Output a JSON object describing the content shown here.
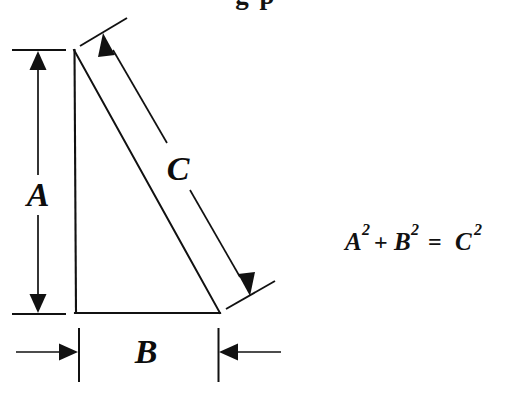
{
  "figure": {
    "kind": "geometry-diagram",
    "background_color": "#ffffff",
    "ink_color": "#111111",
    "width": 512,
    "height": 396
  },
  "clipped_title": {
    "text": "g  p",
    "note_visible": "partially cropped text at very top edge"
  },
  "labels": {
    "side_a": "A",
    "side_b": "B",
    "side_c": "C"
  },
  "equation": {
    "full": "A² + B² = C²",
    "term1_base": "A",
    "term1_exp": "2",
    "operator_plus": "+",
    "term2_base": "B",
    "term2_exp": "2",
    "operator_equals": "=",
    "term3_base": "C",
    "term3_exp": "2"
  },
  "geometry": {
    "triangle": {
      "apex": [
        73,
        50
      ],
      "bottom_left": [
        76,
        313
      ],
      "bottom_right": [
        219,
        313
      ],
      "right_angle_at": "bottom_left"
    },
    "dimension_a": {
      "orientation": "vertical",
      "x": 38,
      "y_top": 50,
      "y_bottom": 314,
      "label_y": 196,
      "ext_line_top": [
        12,
        65,
        50
      ],
      "ext_line_bottom": [
        12,
        65,
        314
      ]
    },
    "dimension_b": {
      "orientation": "horizontal",
      "y": 352,
      "x_left": 79,
      "x_right": 218,
      "label_x": 146,
      "ext_line_left_x": 79,
      "ext_line_right_x": 218,
      "arrow_direction": "inward-from-outside"
    },
    "dimension_c": {
      "orientation": "diagonal",
      "start": [
        98,
        46
      ],
      "end": [
        245,
        288
      ],
      "label_at": [
        178,
        168
      ],
      "parallel_to": "hypotenuse"
    }
  },
  "icons": {
    "arrow_up": "arrow-up-icon",
    "arrow_down": "arrow-down-icon",
    "arrow_left": "arrow-left-icon",
    "arrow_right": "arrow-right-icon",
    "arrow_diag_up": "arrow-diagonal-up-icon",
    "arrow_diag_down": "arrow-diagonal-down-icon"
  }
}
